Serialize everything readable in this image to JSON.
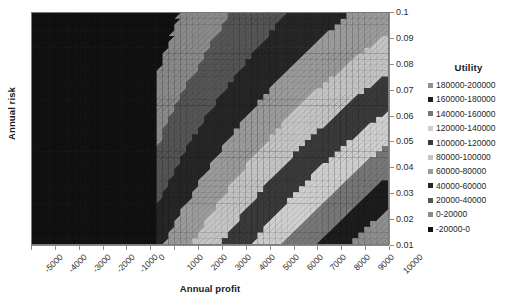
{
  "chart_data": {
    "type": "heatmap",
    "title": "",
    "xlabel": "Annual profit",
    "ylabel": "Annual risk",
    "xlim": [
      -5000,
      10000
    ],
    "ylim": [
      0.01,
      0.1
    ],
    "grid": false,
    "legend_position": "right",
    "legend_title": "Utility",
    "x_ticks": [
      "-5000",
      "-4000",
      "-3000",
      "-2000",
      "-1000",
      "0",
      "1000",
      "2000",
      "3000",
      "4000",
      "5000",
      "6000",
      "7000",
      "8000",
      "9000",
      "10000"
    ],
    "y_ticks": [
      "0.1",
      "0.09",
      "0.08",
      "0.07",
      "0.06",
      "0.05",
      "0.04",
      "0.03",
      "0.02",
      "0.01"
    ],
    "bands": [
      {
        "label": "180000-200000",
        "color": "#8f8f8f",
        "min": 180000,
        "max": 200000
      },
      {
        "label": "160000-180000",
        "color": "#1c1c1c",
        "min": 160000,
        "max": 180000
      },
      {
        "label": "140000-160000",
        "color": "#777777",
        "min": 140000,
        "max": 160000
      },
      {
        "label": "120000-140000",
        "color": "#cfcfcf",
        "min": 120000,
        "max": 140000
      },
      {
        "label": "100000-120000",
        "color": "#3a3a3a",
        "min": 100000,
        "max": 120000
      },
      {
        "label": "80000-100000",
        "color": "#c4c4c4",
        "min": 80000,
        "max": 100000
      },
      {
        "label": "60000-80000",
        "color": "#9b9b9b",
        "min": 60000,
        "max": 80000
      },
      {
        "label": "40000-60000",
        "color": "#262626",
        "min": 40000,
        "max": 60000
      },
      {
        "label": "20000-40000",
        "color": "#555555",
        "min": 20000,
        "max": 40000
      },
      {
        "label": "0-20000",
        "color": "#8a8a8a",
        "min": 0,
        "max": 20000
      },
      {
        "label": "-20000-0",
        "color": "#111111",
        "min": -20000,
        "max": 0
      }
    ]
  },
  "axes": {
    "y_title": "Annual risk",
    "x_title": "Annual profit"
  }
}
